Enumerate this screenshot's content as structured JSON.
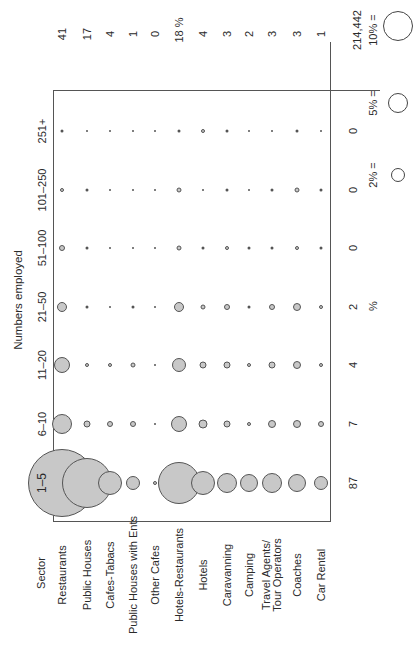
{
  "chart_data": {
    "type": "scatter",
    "subtype": "bubble-matrix",
    "orientation": "rotated-90-ccw",
    "title": "Numbers employed",
    "row_header": "Sector",
    "size_classes": [
      "1–5",
      "6–10",
      "11–20",
      "21–50",
      "51–100",
      "101–250",
      "251+"
    ],
    "size_class_totals_pct": [
      "87",
      "7",
      "4",
      "2",
      "0",
      "0",
      "0"
    ],
    "size_class_totals_unit": "%",
    "sectors": [
      "Restaurants",
      "Public Houses",
      "Cafes-Tabacs",
      "Public Houses with Ents",
      "Other Cafes",
      "Hotels-Restaurants",
      "Hotels",
      "Caravanning",
      "Camping",
      "Travel Agents/ Tour Operators",
      "Coaches",
      "Car Rental"
    ],
    "sector_totals_pct": [
      "41",
      "17",
      "4",
      "1",
      "0",
      "18 %",
      "4",
      "3",
      "2",
      "3",
      "3",
      "1"
    ],
    "grand_total": "214,442",
    "legend": [
      {
        "label": "2% =",
        "r": 7
      },
      {
        "label": "5% =",
        "r": 10
      },
      {
        "label": "10% =",
        "r": 15
      }
    ],
    "bubble_radii_px": {
      "1–5": [
        34,
        25,
        12,
        7,
        2,
        21,
        12,
        10,
        9,
        10,
        9,
        7
      ],
      "6–10": [
        10,
        3.5,
        3,
        3,
        1,
        8,
        4.5,
        3.5,
        2,
        4,
        4,
        3
      ],
      "11–20": [
        8,
        2,
        2,
        2.5,
        1,
        7,
        3.5,
        3.5,
        2,
        3.5,
        4,
        2
      ],
      "21–50": [
        5,
        1.5,
        1,
        1.5,
        1,
        5,
        2.5,
        3,
        1.5,
        3,
        4,
        2
      ],
      "51–100": [
        3,
        1.5,
        1,
        1,
        1,
        2.5,
        1.5,
        2,
        1.5,
        1.5,
        2,
        1.5
      ],
      "101–250": [
        2,
        1.5,
        1,
        1,
        1,
        2.5,
        1,
        1.5,
        1,
        1.5,
        2.5,
        1.5
      ],
      "251+": [
        1.5,
        1,
        1,
        1,
        1,
        1.5,
        2,
        1.5,
        1,
        1,
        1.5,
        1
      ]
    },
    "xlabel": "Sector",
    "ylabel": "Numbers employed"
  }
}
